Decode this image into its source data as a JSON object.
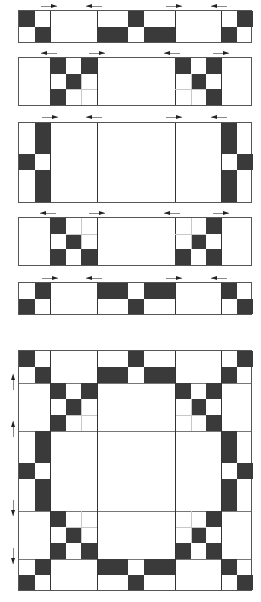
{
  "diagram": {
    "title": "",
    "type": "quilt-block-assembly",
    "unit_px": 15.6,
    "colors": {
      "dark": "#3a3a3a",
      "light": "#ffffff",
      "outline": "#555555",
      "guide": "#c8c8c8"
    },
    "strips": [
      {
        "id": "row-1",
        "rows": 2,
        "arrows_top": [
          "right",
          "left",
          "right",
          "left"
        ],
        "arrows_bottom": []
      },
      {
        "id": "row-2",
        "rows": 3,
        "arrows_top": [
          "left",
          "right",
          "left",
          "right"
        ],
        "arrows_bottom": [
          "right",
          "left",
          "right",
          "left"
        ]
      },
      {
        "id": "row-3",
        "rows": 5,
        "arrows_top": [
          "right",
          "left",
          "right",
          "left"
        ],
        "arrows_bottom": []
      },
      {
        "id": "row-4",
        "rows": 3,
        "arrows_top": [
          "left",
          "right",
          "left",
          "right"
        ],
        "arrows_bottom": []
      },
      {
        "id": "row-5",
        "rows": 2,
        "arrows_top": [
          "right",
          "left",
          "right",
          "left"
        ],
        "arrows_bottom": []
      }
    ],
    "assembled_block": {
      "id": "finished-block",
      "grid": "15x15",
      "side_arrows": [
        "up",
        "up",
        "down",
        "down"
      ]
    },
    "caption": ""
  }
}
